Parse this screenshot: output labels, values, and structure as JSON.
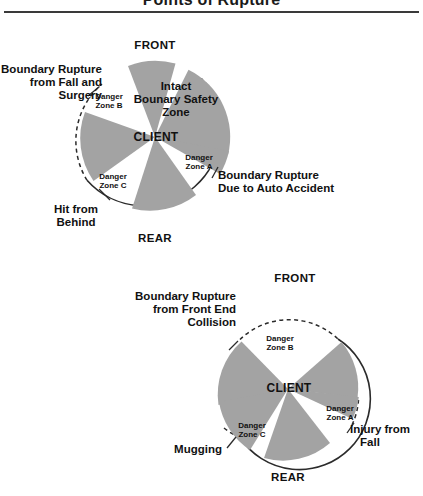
{
  "title": "Points of Rupture",
  "colors": {
    "sector_gray": "#a3a3a3",
    "outline": "#2b2b2b",
    "text": "#111111",
    "background": "#ffffff"
  },
  "diagrams": [
    {
      "id": "upper-diagram",
      "name": "client-boundary-diagram-upper",
      "center_label": "CLIENT",
      "cardinals": {
        "front": "FRONT",
        "rear": "REAR"
      },
      "intact_zone_label": "Intact\nBounary Safety\nZone",
      "has_intact_zone": true,
      "zones": [
        {
          "id": "zone-a",
          "label": "Danger\nZone A"
        },
        {
          "id": "zone-b",
          "label": "Danger\nZone B"
        },
        {
          "id": "zone-c",
          "label": "Danger\nZone C"
        }
      ],
      "callouts": [
        {
          "id": "callout-fall-surgery",
          "text": "Boundary Rupture\nfrom Fall and\nSurgery",
          "align": "right"
        },
        {
          "id": "callout-auto-accident",
          "text": "Boundary Rupture\nDue to Auto Accident",
          "align": "left"
        },
        {
          "id": "callout-hit-from-behind",
          "text": "Hit from\nBehind",
          "align": "center"
        }
      ]
    },
    {
      "id": "lower-diagram",
      "name": "client-boundary-diagram-lower",
      "center_label": "CLIENT",
      "cardinals": {
        "front": "FRONT",
        "rear": "REAR"
      },
      "intact_zone_label": "",
      "has_intact_zone": false,
      "zones": [
        {
          "id": "zone-a",
          "label": "Danger\nZone A"
        },
        {
          "id": "zone-b",
          "label": "Danger\nZone B"
        },
        {
          "id": "zone-c",
          "label": "Danger\nZone C"
        }
      ],
      "callouts": [
        {
          "id": "callout-front-end-collision",
          "text": "Boundary Rupture\nfrom Front End\nCollision",
          "align": "right"
        },
        {
          "id": "callout-injury-from-fall",
          "text": "Injury from\nFall",
          "align": "left"
        },
        {
          "id": "callout-mugging",
          "text": "Mugging",
          "align": "center"
        }
      ]
    }
  ],
  "upper": {
    "front": "FRONT",
    "rear": "REAR",
    "client": "CLIENT",
    "intact_line1": "Intact",
    "intact_line2": "Bounary Safety",
    "intact_line3": "Zone",
    "zone_a_l1": "Danger",
    "zone_a_l2": "Zone A",
    "zone_b_l1": "Danger",
    "zone_b_l2": "Zone B",
    "zone_c_l1": "Danger",
    "zone_c_l2": "Zone C",
    "callout_left_l1": "Boundary Rupture",
    "callout_left_l2": "from Fall and",
    "callout_left_l3": "Surgery",
    "callout_right_l1": "Boundary Rupture",
    "callout_right_l2": "Due to Auto Accident",
    "callout_bottom_l1": "Hit from",
    "callout_bottom_l2": "Behind"
  },
  "lower": {
    "front": "FRONT",
    "rear": "REAR",
    "client": "CLIENT",
    "zone_a_l1": "Danger",
    "zone_a_l2": "Zone A",
    "zone_b_l1": "Danger",
    "zone_b_l2": "Zone B",
    "zone_c_l1": "Danger",
    "zone_c_l2": "Zone C",
    "callout_left_l1": "Boundary Rupture",
    "callout_left_l2": "from Front End",
    "callout_left_l3": "Collision",
    "callout_right_l1": "Injury from",
    "callout_right_l2": "Fall",
    "callout_bottom_l1": "Mugging"
  }
}
